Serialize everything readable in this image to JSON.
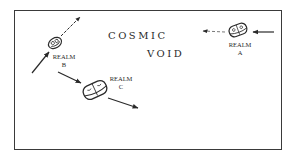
{
  "diagram": {
    "title_line1": "COSMIC",
    "title_line2": "VOID",
    "realms": [
      {
        "id": "A",
        "label": "REALM",
        "letter": "A",
        "incoming_arrow": "solid, from right",
        "outgoing_arrow": "dashed, to left"
      },
      {
        "id": "B",
        "label": "REALM",
        "letter": "B",
        "incoming_arrow": "solid, from lower-left",
        "outgoing_arrow": "dashed, to upper-right"
      },
      {
        "id": "C",
        "label": "REALM",
        "letter": "C",
        "incoming_arrow": "solid, from upper-left",
        "outgoing_arrow": "solid, to lower-right"
      }
    ],
    "colors": {
      "ink": "#2a2a2a",
      "background": "#ffffff"
    }
  }
}
